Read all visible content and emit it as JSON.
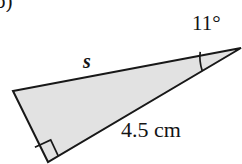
{
  "figure": {
    "part_label": "b)",
    "background_color": "#ffffff",
    "shape": {
      "name": "right-triangle",
      "fill_color": "#e2e2e2",
      "stroke_color": "#181818",
      "stroke_width": 2,
      "vertices": {
        "left": {
          "x": 13,
          "y": 91
        },
        "bottom": {
          "x": 48,
          "y": 162
        },
        "apex": {
          "x": 241,
          "y": 48
        }
      }
    },
    "markers": {
      "right_angle": {
        "name": "right-angle-marker",
        "at_vertex": "bottom",
        "size": 17
      },
      "angle_arc": {
        "name": "angle-arc-marker",
        "at_vertex": "apex",
        "radius": 42,
        "measure": "11"
      }
    },
    "labels": {
      "angle": "11°",
      "hypotenuse": "s",
      "base": "4.5 cm"
    }
  }
}
